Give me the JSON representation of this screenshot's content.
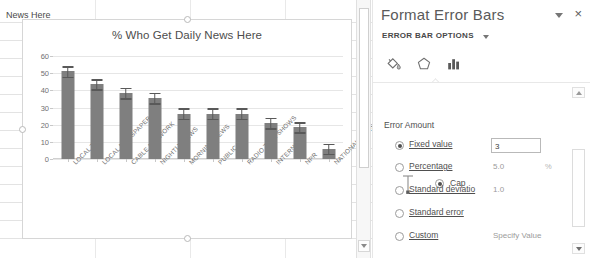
{
  "spreadsheet": {
    "visible_cell_text": "News Here"
  },
  "chart_data": {
    "type": "bar",
    "title": "% Who Get Daily News Here",
    "xlabel": "",
    "ylabel": "",
    "ylim": [
      0,
      60
    ],
    "ytick_labels": [
      "0",
      "10",
      "20",
      "30",
      "40",
      "50",
      "60"
    ],
    "yticks": [
      0,
      10,
      20,
      30,
      40,
      50,
      60
    ],
    "grid": true,
    "legend": "none",
    "bar_color": "#7f7f7f",
    "error_bar_color": "#595959",
    "error_bar_style": "Cap",
    "error_value": 3,
    "categories": [
      "LOCAL TV",
      "LOCAL NEWSPAPER",
      "CABLE NETWORK",
      "NIGHTLY NEWS",
      "MORNING NEWS",
      "PUBLIC TV",
      "RADIO TALK SHOWS",
      "INTERNET",
      "NPR",
      "NATIONAL NEWSPAPERS"
    ],
    "values": [
      51,
      43.5,
      38.5,
      35.5,
      26.5,
      26.5,
      26.5,
      21,
      18.5,
      6
    ],
    "errors": [
      3,
      3,
      3,
      3,
      3,
      3,
      3,
      3,
      3,
      3
    ]
  },
  "sheet_scrollbar": {
    "down_arrow_icon": "arrow-down-icon"
  },
  "pane": {
    "title": "Format Error Bars",
    "dropdown_icon": "chevron-down-icon",
    "close_label": "×",
    "close_icon": "close-icon",
    "subtitle": "ERROR BAR OPTIONS",
    "subtitle_caret_icon": "chevron-down-icon",
    "tabs": [
      {
        "name": "fill-line",
        "icon": "paint-bucket-icon",
        "selected": false
      },
      {
        "name": "effects",
        "icon": "pentagon-effects-icon",
        "selected": false
      },
      {
        "name": "options",
        "icon": "bar-chart-icon",
        "selected": true
      }
    ],
    "direction": {
      "icon": "error-bar-cap-icon",
      "cap_label": "Cap",
      "cap_selected": true
    },
    "error_amount": {
      "heading": "Error Amount",
      "options": [
        {
          "label": "Fixed value",
          "mnemonic": "F",
          "selected": true,
          "value": "3",
          "value_kind": "input"
        },
        {
          "label": "Percentage",
          "mnemonic": "P",
          "selected": false,
          "value": "5.0",
          "value_kind": "text",
          "suffix": "%"
        },
        {
          "label": "Standard deviatio",
          "mnemonic": "S",
          "selected": false,
          "value": "1.0",
          "value_kind": "text"
        },
        {
          "label": "Standard error",
          "mnemonic": "e",
          "selected": false,
          "value": "",
          "value_kind": "none"
        },
        {
          "label": "Custom",
          "mnemonic": "C",
          "selected": false,
          "value": "Specify Value",
          "value_kind": "button"
        }
      ]
    },
    "scrollbar": {
      "up_icon": "arrow-up-icon",
      "down_icon": "arrow-down-icon"
    }
  }
}
